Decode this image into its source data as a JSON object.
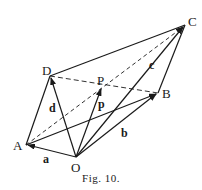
{
  "figure": {
    "caption": "Fig. 10.",
    "points": {
      "O": {
        "label": "O",
        "x": 76,
        "y": 157
      },
      "A": {
        "label": "A",
        "x": 26,
        "y": 145
      },
      "B": {
        "label": "B",
        "x": 158,
        "y": 93
      },
      "C": {
        "label": "C",
        "x": 185,
        "y": 25
      },
      "D": {
        "label": "D",
        "x": 50,
        "y": 76
      },
      "P": {
        "label": "P",
        "x": 102,
        "y": 87
      }
    },
    "vector_labels": {
      "a": "a",
      "b": "b",
      "c": "c",
      "d": "d",
      "p": "p"
    },
    "colors": {
      "ink": "#1a1a1a",
      "background": "#ffffff"
    }
  }
}
